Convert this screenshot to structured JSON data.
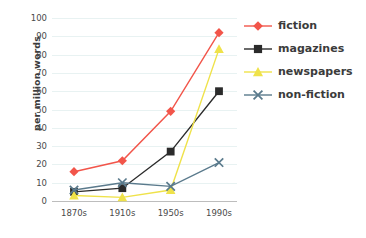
{
  "chart_data": {
    "type": "line",
    "title": "",
    "xlabel": "",
    "ylabel": "per million words",
    "categories": [
      "1870s",
      "1910s",
      "1950s",
      "1990s"
    ],
    "ylim": [
      0,
      100
    ],
    "yticks": [
      0,
      10,
      20,
      30,
      40,
      50,
      60,
      70,
      80,
      90,
      100
    ],
    "grid": true,
    "legend_position": "right",
    "series": [
      {
        "name": "fiction",
        "color": "#f2554a",
        "marker": "diamond",
        "values": [
          16,
          22,
          49,
          92
        ]
      },
      {
        "name": "magazines",
        "color": "#2b2b2b",
        "marker": "square",
        "values": [
          5,
          7,
          27,
          60
        ]
      },
      {
        "name": "newspapers",
        "color": "#efe24a",
        "marker": "triangle",
        "values": [
          3,
          2,
          6,
          83
        ]
      },
      {
        "name": "non-fiction",
        "color": "#5a7a8c",
        "marker": "x",
        "values": [
          6,
          10,
          8,
          21
        ]
      }
    ]
  },
  "axis": {
    "ylabel": "per million words",
    "ytick_labels": [
      "0",
      "10",
      "20",
      "30",
      "40",
      "50",
      "60",
      "70",
      "80",
      "90",
      "100"
    ],
    "xtick_labels": [
      "1870s",
      "1910s",
      "1950s",
      "1990s"
    ]
  },
  "legend": {
    "items": [
      {
        "label": "fiction"
      },
      {
        "label": "magazines"
      },
      {
        "label": "newspapers"
      },
      {
        "label": "non-fiction"
      }
    ]
  }
}
